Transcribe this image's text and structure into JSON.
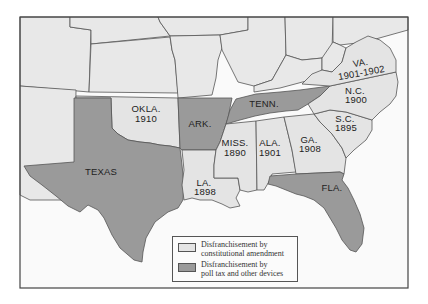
{
  "map": {
    "title": "Disfranchisement in the South",
    "colors": {
      "constitutional": "#e4e4e4",
      "poll_tax": "#9a9a9a",
      "other_states": "#e8e8e8",
      "water": "#fafafa",
      "border": "#555555"
    },
    "states": [
      {
        "abbr": "OKLA.",
        "year": "1910",
        "category": "constitutional"
      },
      {
        "abbr": "ARK.",
        "year": "",
        "category": "poll_tax"
      },
      {
        "abbr": "TENN.",
        "year": "",
        "category": "poll_tax"
      },
      {
        "abbr": "TEXAS",
        "year": "",
        "category": "poll_tax"
      },
      {
        "abbr": "LA.",
        "year": "1898",
        "category": "constitutional"
      },
      {
        "abbr": "MISS.",
        "year": "1890",
        "category": "constitutional"
      },
      {
        "abbr": "ALA.",
        "year": "1901",
        "category": "constitutional"
      },
      {
        "abbr": "GA.",
        "year": "1908",
        "category": "constitutional"
      },
      {
        "abbr": "S.C.",
        "year": "1895",
        "category": "constitutional"
      },
      {
        "abbr": "N.C.",
        "year": "1900",
        "category": "constitutional"
      },
      {
        "abbr": "VA.",
        "year": "1901-1902",
        "category": "constitutional"
      },
      {
        "abbr": "FLA.",
        "year": "",
        "category": "poll_tax"
      }
    ]
  },
  "legend": {
    "items": [
      {
        "line1": "Disfranchisement by",
        "line2": "constitutional amendment",
        "swatch": "light"
      },
      {
        "line1": "Disfranchisement by",
        "line2": "poll tax and other devices",
        "swatch": "dark"
      }
    ]
  }
}
